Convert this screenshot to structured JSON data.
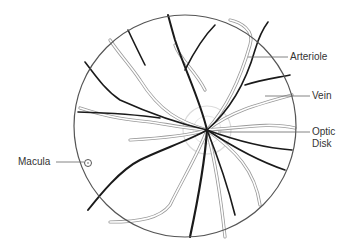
{
  "diagram": {
    "type": "retina fundus illustration",
    "labels": {
      "arteriole": "Arteriole",
      "vein": "Vein",
      "optic_disk_line1": "Optic",
      "optic_disk_line2": "Disk",
      "macula": "Macula"
    },
    "colors": {
      "artery": "#1a1a1a",
      "vein_outline": "#9a9a9a",
      "circle": "#555555",
      "leader": "#666666"
    }
  }
}
